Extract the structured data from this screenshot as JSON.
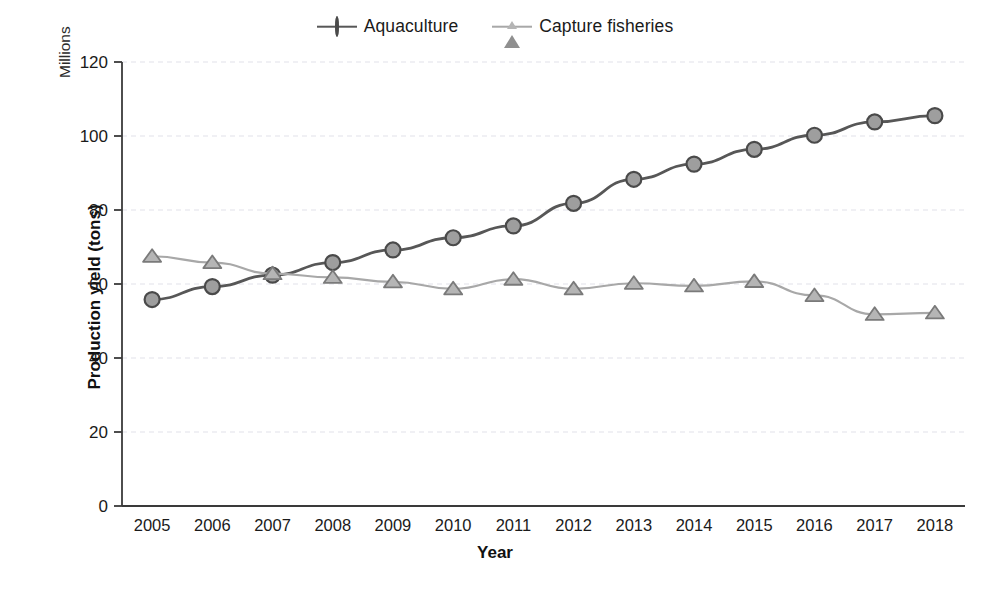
{
  "chart_data": {
    "type": "line",
    "title": "",
    "xlabel": "Year",
    "ylabel": "Production yield (tons)",
    "y_units_label": "Millions",
    "categories": [
      "2005",
      "2006",
      "2007",
      "2008",
      "2009",
      "2010",
      "2011",
      "2012",
      "2013",
      "2014",
      "2015",
      "2016",
      "2017",
      "2018"
    ],
    "x": [
      2005,
      2006,
      2007,
      2008,
      2009,
      2010,
      2011,
      2012,
      2013,
      2014,
      2015,
      2016,
      2017,
      2018
    ],
    "ylim": [
      0,
      120
    ],
    "yticks": [
      0,
      20,
      40,
      60,
      80,
      100,
      120
    ],
    "grid": true,
    "legend_position": "top-center",
    "series": [
      {
        "name": "Aquaculture",
        "marker": "circle",
        "color": "#575757",
        "marker_fill": "#9e9e9e",
        "values": [
          55.8,
          59.3,
          62.4,
          65.8,
          69.2,
          72.5,
          75.7,
          81.8,
          88.3,
          92.4,
          96.4,
          100.2,
          103.8,
          105.5
        ]
      },
      {
        "name": "Capture fisheries",
        "marker": "triangle",
        "color": "#a8a8a8",
        "marker_fill": "#b5b5b5",
        "values": [
          67.5,
          65.8,
          62.8,
          61.8,
          60.6,
          58.7,
          61.3,
          58.7,
          60.2,
          59.5,
          60.7,
          56.9,
          51.8,
          52.2
        ]
      }
    ]
  },
  "legend": {
    "entries": [
      {
        "label": "Aquaculture"
      },
      {
        "label": "Capture fisheries"
      }
    ]
  },
  "axes": {
    "y_title": "Production yield (tons)",
    "y_units": "Millions",
    "x_title": "Year"
  }
}
